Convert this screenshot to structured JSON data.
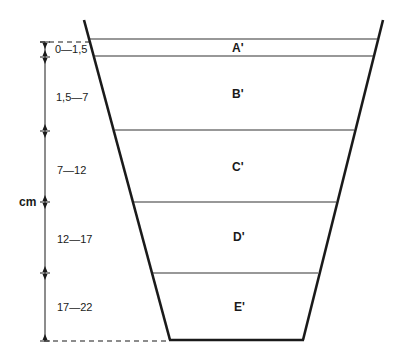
{
  "diagram": {
    "unit_label": "cm",
    "layers": [
      {
        "name": "A'",
        "depth_range": "0—1,5"
      },
      {
        "name": "B'",
        "depth_range": "1,5—7"
      },
      {
        "name": "C'",
        "depth_range": "7—12"
      },
      {
        "name": "D'",
        "depth_range": "12—17"
      },
      {
        "name": "E'",
        "depth_range": "17—22"
      }
    ],
    "colors": {
      "line": "#1a1a1a",
      "background": "#ffffff"
    }
  }
}
